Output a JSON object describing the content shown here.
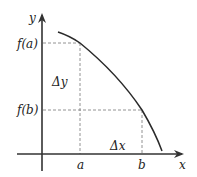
{
  "diagram": {
    "type": "function-graph",
    "axes": {
      "x_label": "x",
      "y_label": "y"
    },
    "x_ticks": [
      {
        "label": "a"
      },
      {
        "label": "b"
      }
    ],
    "y_ticks": [
      {
        "label": "f(a)"
      },
      {
        "label": "f(b)"
      }
    ],
    "annotations": {
      "delta_y": "Δy",
      "delta_x": "Δx"
    },
    "colors": {
      "axis": "#333333",
      "curve": "#2a2a2a",
      "guide": "#777777",
      "background": "#ffffff"
    }
  }
}
